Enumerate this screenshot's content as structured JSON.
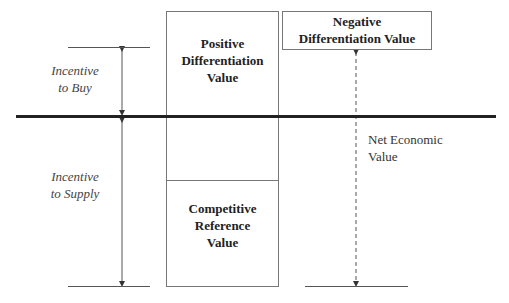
{
  "diagram": {
    "labels": {
      "incentive_to_buy_line1": "Incentive",
      "incentive_to_buy_line2": "to Buy",
      "incentive_to_supply_line1": "Incentive",
      "incentive_to_supply_line2": "to Supply",
      "positive_line1": "Positive",
      "positive_line2": "Differentiation",
      "positive_line3": "Value",
      "competitive_line1": "Competitive",
      "competitive_line2": "Reference",
      "competitive_line3": "Value",
      "negative_line1": "Negative",
      "negative_line2": "Differentiation Value",
      "net_line1": "Net Economic",
      "net_line2": "Value"
    }
  }
}
